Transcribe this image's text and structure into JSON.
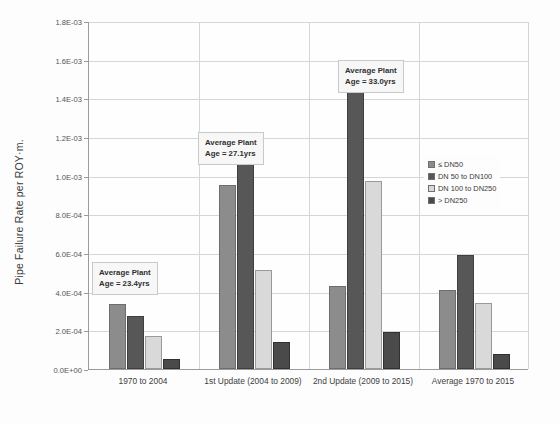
{
  "chart_data": {
    "type": "bar",
    "title": "",
    "subtitle": "",
    "xlabel": "",
    "ylabel": "Pipe Failure Rate per ROY·m.",
    "ylim": [
      0,
      0.0018
    ],
    "grid": true,
    "legend_position": "right",
    "categories": [
      "1970 to 2004",
      "1st Update (2004 to 2009)",
      "2nd Update (2009 to 2015)",
      "Average 1970 to 2015"
    ],
    "ytick_labels": [
      "1.8E-03",
      "1.6E-03",
      "1.4E-03",
      "1.2E-03",
      "1.0E-03",
      "8.0E-04",
      "6.0E-04",
      "4.0E-04",
      "2.0E-04",
      "0.0E+00"
    ],
    "ytick_values": [
      0.0018,
      0.0016,
      0.0014,
      0.0012,
      0.001,
      0.0008,
      0.0006,
      0.0004,
      0.0002,
      0.0
    ],
    "series": [
      {
        "name": "≤ DN50",
        "color": "#8c8c8c",
        "values": [
          0.000335,
          0.00095,
          0.00043,
          0.00041
        ]
      },
      {
        "name": "DN 50 to DN100",
        "color": "#575757",
        "values": [
          0.000275,
          0.00107,
          0.0016,
          0.00059
        ]
      },
      {
        "name": "DN 100 to DN250",
        "color": "#d9d9d9",
        "values": [
          0.00017,
          0.00051,
          0.00097,
          0.00034
        ]
      },
      {
        "name": "> DN250",
        "color": "#4a4a4a",
        "values": [
          5e-05,
          0.00014,
          0.00019,
          8e-05
        ]
      }
    ],
    "annotations": [
      {
        "line1": "Average Plant",
        "line2": "Age = 23.4yrs",
        "group": "1970 to 2004"
      },
      {
        "line1": "Average Plant",
        "line2": "Age = 27.1yrs",
        "group": "1st Update (2004 to 2009)"
      },
      {
        "line1": "Average Plant",
        "line2": "Age = 33.0yrs",
        "group": "2nd Update (2009 to 2015)"
      }
    ]
  }
}
